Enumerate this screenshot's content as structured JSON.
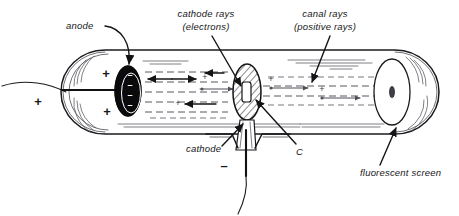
{
  "diagram": {
    "background_color": "#ffffff",
    "ink_color": "#17171a",
    "labels": {
      "anode": "anode",
      "cathode_rays_line1": "cathode rays",
      "cathode_rays_line2": "(electrons)",
      "canal_rays_line1": "canal rays",
      "canal_rays_line2": "(positive rays)",
      "cathode": "cathode",
      "channel": "C",
      "fluorescent_screen": "fluorescent screen"
    },
    "symbols": {
      "external_plus": "+",
      "anode_plus_upper": "+",
      "anode_plus_lower": "+",
      "anode_minus_1": "–",
      "anode_minus_2": "–",
      "anode_minus_3": "–",
      "anode_minus_4": "–",
      "cathode_minus": "–",
      "ion_plus_left": "+",
      "ion_plus_right_a": "+",
      "ion_plus_right_b": "+",
      "faint_plus_left": "+",
      "faint_plus_mid": "+"
    },
    "parts": {
      "tube": "glass-discharge-tube",
      "anode_electrode": "anode-disc",
      "cathode_electrode": "perforated-cathode-disc",
      "channel_slit": "cathode-channel-C",
      "screen": "fluorescent-screen-dome",
      "anode_lead": "anode-lead-wire",
      "cathode_stem": "cathode-stem-wire"
    },
    "ray_directions": {
      "cathode_rays": "right-to-left",
      "canal_rays": "left-to-right"
    }
  }
}
